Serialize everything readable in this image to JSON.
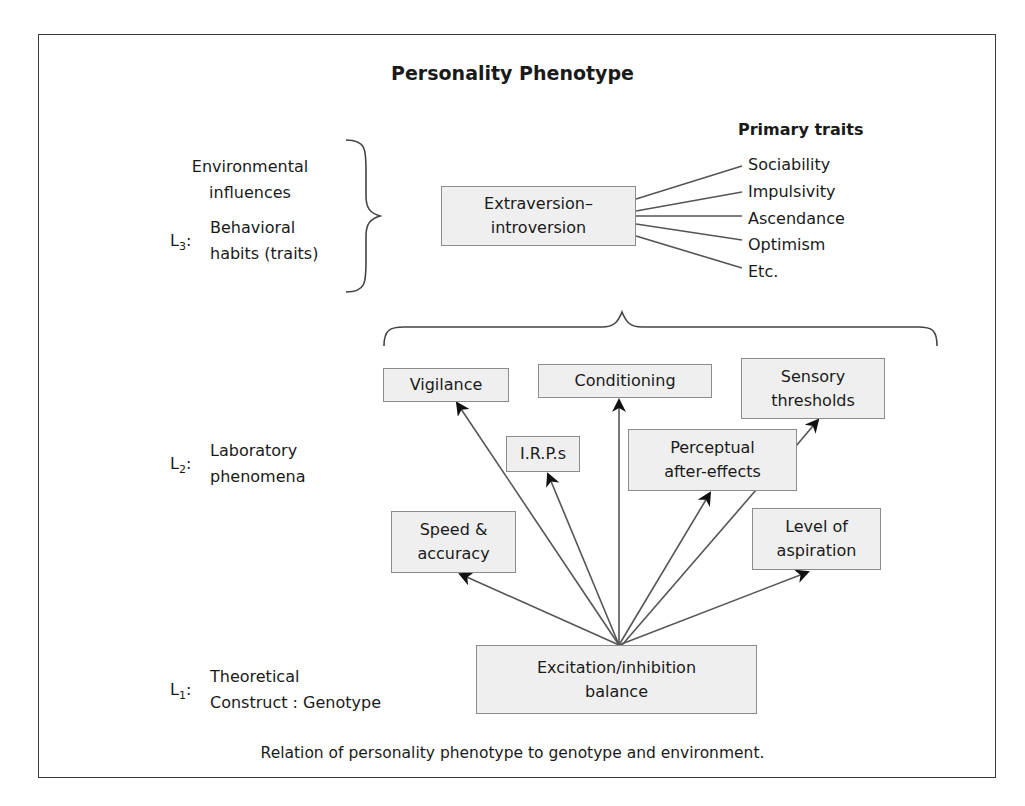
{
  "title": "Personality Phenotype",
  "levels": {
    "environment": {
      "line1": "Environmental",
      "line2": "influences"
    },
    "l3": {
      "label": "L",
      "sub": "3",
      "line1": "Behavioral",
      "line2": "habits (traits)"
    },
    "l2": {
      "label": "L",
      "sub": "2",
      "line1": "Laboratory",
      "line2": "phenomena"
    },
    "l1": {
      "label": "L",
      "sub": "1",
      "line1": "Theoretical",
      "line2": "Construct : Genotype"
    }
  },
  "trait_box": {
    "line1": "Extraversion–",
    "line2": "introversion"
  },
  "primary_traits": {
    "header": "Primary traits",
    "items": [
      "Sociability",
      "Impulsivity",
      "Ascendance",
      "Optimism",
      "Etc."
    ]
  },
  "phenomena": {
    "vigilance": "Vigilance",
    "conditioning": "Conditioning",
    "sensory": {
      "line1": "Sensory",
      "line2": "thresholds"
    },
    "irps": "I.R.P.s",
    "perceptual": {
      "line1": "Perceptual",
      "line2": "after-effects"
    },
    "speed": {
      "line1": "Speed &",
      "line2": "accuracy"
    },
    "aspiration": {
      "line1": "Level of",
      "line2": "aspiration"
    }
  },
  "genotype_box": {
    "line1": "Excitation/inhibition",
    "line2": "balance"
  },
  "caption": "Relation of personality phenotype to genotype and environment.",
  "colors": {
    "box_fill": "#efefef",
    "box_border": "#8c8c8c",
    "line": "#555555",
    "arrow": "#111111"
  }
}
